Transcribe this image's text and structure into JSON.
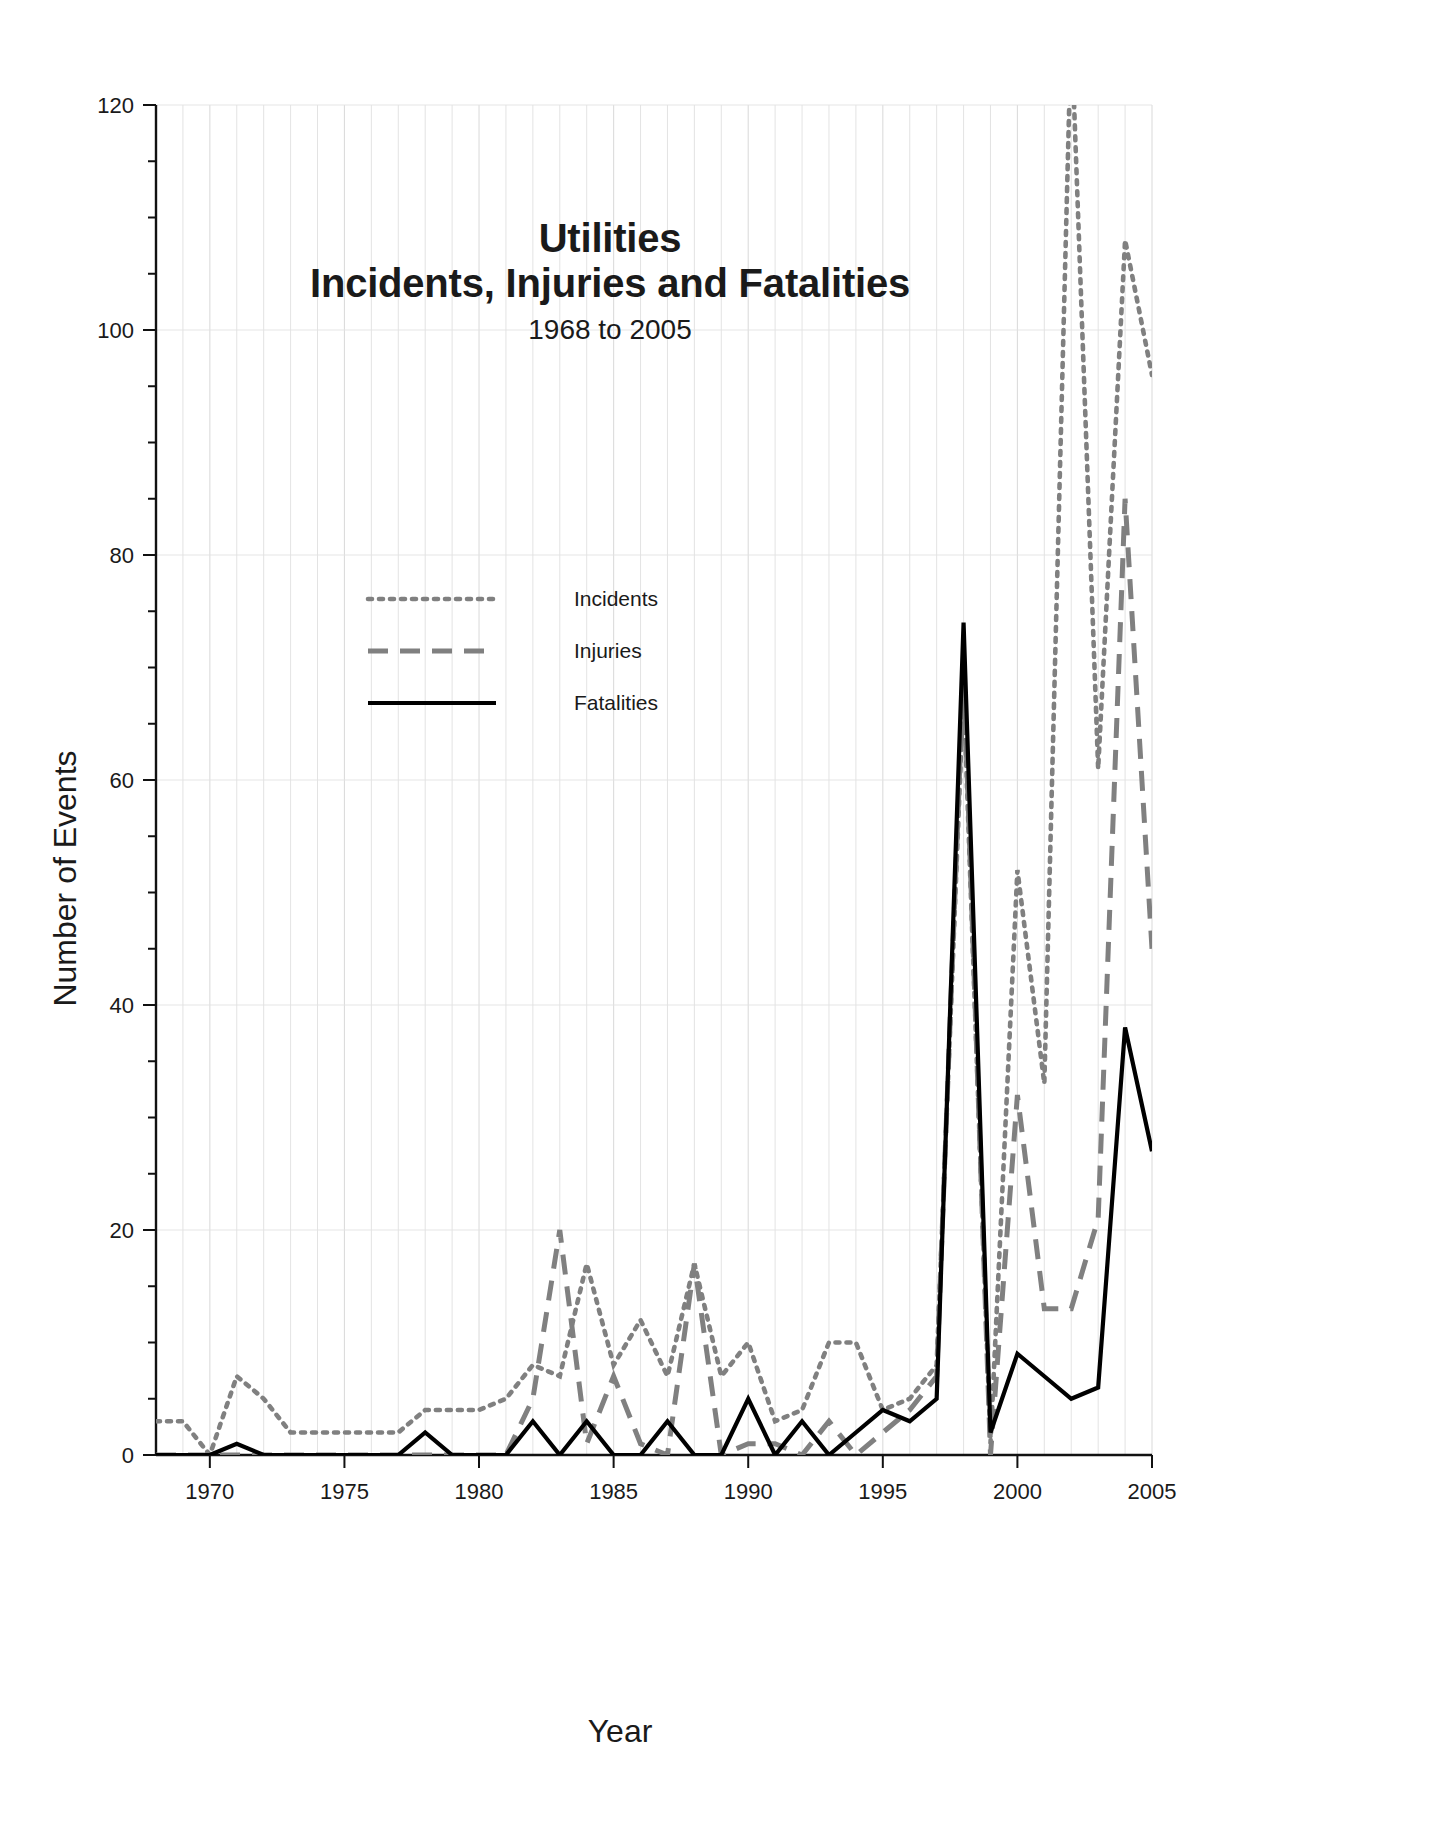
{
  "figure": {
    "title_line1": "Utilities",
    "title_line2": "Incidents, Injuries and Fatalities",
    "subtitle": "1968 to 2005",
    "axis_title_y": "Number of Events",
    "axis_title_x": "Year"
  },
  "legend": {
    "items": [
      {
        "label": "Incidents",
        "style": "dotted",
        "color": "#808080"
      },
      {
        "label": "Injuries",
        "style": "dashed",
        "color": "#808080"
      },
      {
        "label": "Fatalities",
        "style": "solid",
        "color": "#000000"
      }
    ]
  },
  "axes": {
    "y_ticks": [
      "0",
      "20",
      "40",
      "60",
      "80",
      "100",
      "120"
    ],
    "x_ticks": [
      "1970",
      "1975",
      "1980",
      "1985",
      "1990",
      "1995",
      "2000",
      "2005"
    ]
  },
  "chart_data": {
    "type": "line",
    "subtitle": "1968 to 2005",
    "xlabel": "Year",
    "ylabel": "Number of Events",
    "xlim": [
      1968,
      2005
    ],
    "ylim": [
      0,
      120
    ],
    "y_major_step": 20,
    "y_minor_step": 5,
    "x_major_step": 5,
    "x_minor_step": 1,
    "grid": "vertical minor + horizontal major, light gray",
    "legend_position": "upper-left inside plot",
    "clipped_note": "Incidents exceeds the 120 top axis limit in 2002",
    "x": [
      1968,
      1969,
      1970,
      1971,
      1972,
      1973,
      1974,
      1975,
      1976,
      1977,
      1978,
      1979,
      1980,
      1981,
      1982,
      1983,
      1984,
      1985,
      1986,
      1987,
      1988,
      1989,
      1990,
      1991,
      1992,
      1993,
      1994,
      1995,
      1996,
      1997,
      1998,
      1999,
      2000,
      2001,
      2002,
      2003,
      2004,
      2005
    ],
    "series": [
      {
        "name": "Incidents",
        "style": "dotted",
        "color": "#808080",
        "values": [
          3,
          3,
          0,
          7,
          5,
          2,
          2,
          2,
          2,
          2,
          4,
          4,
          4,
          5,
          8,
          7,
          17,
          8,
          12,
          7,
          17,
          7,
          10,
          3,
          4,
          10,
          10,
          4,
          5,
          8,
          68,
          1,
          52,
          33,
          127,
          61,
          108,
          96
        ]
      },
      {
        "name": "Injuries",
        "style": "dashed",
        "color": "#808080",
        "values": [
          0,
          0,
          0,
          0,
          0,
          0,
          0,
          0,
          0,
          0,
          0,
          0,
          0,
          0,
          5,
          20,
          1,
          7,
          1,
          0,
          17,
          0,
          1,
          1,
          0,
          3,
          0,
          2,
          4,
          7,
          70,
          0,
          32,
          13,
          13,
          21,
          85,
          45
        ]
      },
      {
        "name": "Fatalities",
        "style": "solid",
        "color": "#000000",
        "values": [
          0,
          0,
          0,
          1,
          0,
          0,
          0,
          0,
          0,
          0,
          2,
          0,
          0,
          0,
          3,
          0,
          3,
          0,
          0,
          3,
          0,
          0,
          5,
          0,
          3,
          0,
          2,
          4,
          3,
          5,
          74,
          2,
          9,
          7,
          5,
          6,
          38,
          27
        ]
      }
    ]
  }
}
